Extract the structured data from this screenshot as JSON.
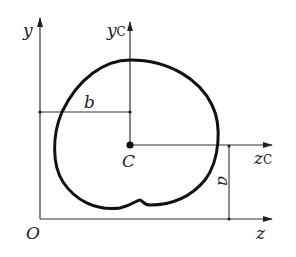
{
  "diagram": {
    "type": "centroid-parallel-axis-figure",
    "axes": {
      "y": "y",
      "z": "z",
      "origin": "O",
      "yc_main": "y",
      "yc_sub": "C",
      "zc_main": "z",
      "zc_sub": "C"
    },
    "centroid_label": "C",
    "dimensions": {
      "horizontal": "b",
      "vertical": "a"
    },
    "colors": {
      "stroke": "#222222",
      "shape_stroke": "#111111",
      "background": "#ffffff"
    }
  }
}
